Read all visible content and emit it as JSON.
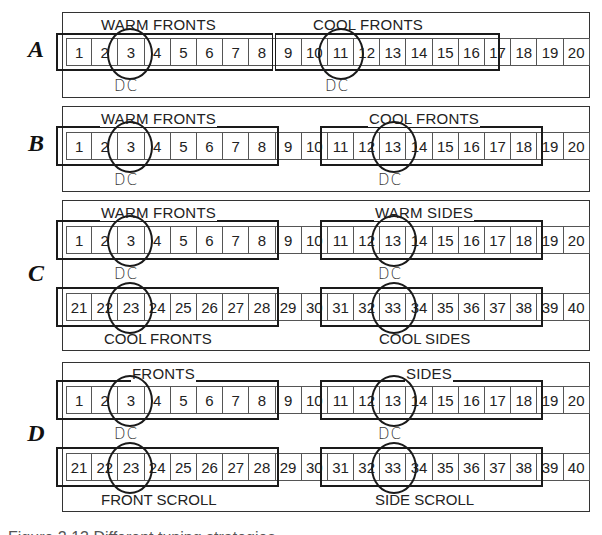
{
  "figure": {
    "caption": "Figure 2.13 Different tuning strategies"
  },
  "panels": [
    {
      "letter": "A",
      "rows": [
        {
          "cells": [
            "1",
            "2",
            "3",
            "4",
            "5",
            "6",
            "7",
            "8",
            "9",
            "10",
            "11",
            "12",
            "13",
            "14",
            "15",
            "16",
            "17",
            "18",
            "19",
            "20"
          ]
        }
      ],
      "groups": [
        {
          "label": "WARM FRONTS",
          "from_cell": 1,
          "to_cell": 8,
          "row": 0,
          "dc_cell": 3,
          "dc_label": "DC"
        },
        {
          "label": "COOL FRONTS",
          "from_cell": 9,
          "to_cell": 16,
          "row": 0,
          "dc_cell": 11,
          "dc_label": "DC"
        }
      ]
    },
    {
      "letter": "B",
      "rows": [
        {
          "cells": [
            "1",
            "2",
            "3",
            "4",
            "5",
            "6",
            "7",
            "8",
            "9",
            "10",
            "11",
            "12",
            "13",
            "14",
            "15",
            "16",
            "17",
            "18",
            "19",
            "20"
          ]
        }
      ],
      "groups": [
        {
          "label": "WARM FRONTS",
          "from_cell": 1,
          "to_cell": 8,
          "row": 0,
          "dc_cell": 3,
          "dc_label": "DC"
        },
        {
          "label": "COOL FRONTS",
          "from_cell": 11,
          "to_cell": 18,
          "row": 0,
          "dc_cell": 13,
          "dc_label": "DC"
        }
      ]
    },
    {
      "letter": "C",
      "rows": [
        {
          "cells": [
            "1",
            "2",
            "3",
            "4",
            "5",
            "6",
            "7",
            "8",
            "9",
            "10",
            "11",
            "12",
            "13",
            "14",
            "15",
            "16",
            "17",
            "18",
            "19",
            "20"
          ]
        },
        {
          "cells": [
            "21",
            "22",
            "23",
            "24",
            "25",
            "26",
            "27",
            "28",
            "29",
            "30",
            "31",
            "32",
            "33",
            "34",
            "35",
            "36",
            "37",
            "38",
            "39",
            "40"
          ]
        }
      ],
      "groups": [
        {
          "label": "WARM FRONTS",
          "from_cell": 1,
          "to_cell": 8,
          "row": 0,
          "dc_cell": 3,
          "dc_label": "DC"
        },
        {
          "label": "WARM SIDES",
          "from_cell": 11,
          "to_cell": 18,
          "row": 0,
          "dc_cell": 13,
          "dc_label": "DC"
        },
        {
          "label": "COOL FRONTS",
          "from_cell": 21,
          "to_cell": 28,
          "row": 1,
          "dc_cell": 23
        },
        {
          "label": "COOL SIDES",
          "from_cell": 31,
          "to_cell": 38,
          "row": 1,
          "dc_cell": 33
        }
      ]
    },
    {
      "letter": "D",
      "rows": [
        {
          "cells": [
            "1",
            "2",
            "3",
            "4",
            "5",
            "6",
            "7",
            "8",
            "9",
            "10",
            "11",
            "12",
            "13",
            "14",
            "15",
            "16",
            "17",
            "18",
            "19",
            "20"
          ]
        },
        {
          "cells": [
            "21",
            "22",
            "23",
            "24",
            "25",
            "26",
            "27",
            "28",
            "29",
            "30",
            "31",
            "32",
            "33",
            "34",
            "35",
            "36",
            "37",
            "38",
            "39",
            "40"
          ]
        }
      ],
      "groups": [
        {
          "label": "FRONTS",
          "from_cell": 1,
          "to_cell": 8,
          "row": 0,
          "dc_cell": 3,
          "dc_label": "DC"
        },
        {
          "label": "SIDES",
          "from_cell": 11,
          "to_cell": 18,
          "row": 0,
          "dc_cell": 13,
          "dc_label": "DC"
        },
        {
          "label": "FRONT SCROLL",
          "from_cell": 21,
          "to_cell": 28,
          "row": 1,
          "dc_cell": 23
        },
        {
          "label": "SIDE SCROLL",
          "from_cell": 31,
          "to_cell": 38,
          "row": 1,
          "dc_cell": 33
        }
      ]
    }
  ],
  "colors": {
    "line": "#1a1a1a",
    "cell_border": "#555555",
    "background": "#ffffff"
  }
}
